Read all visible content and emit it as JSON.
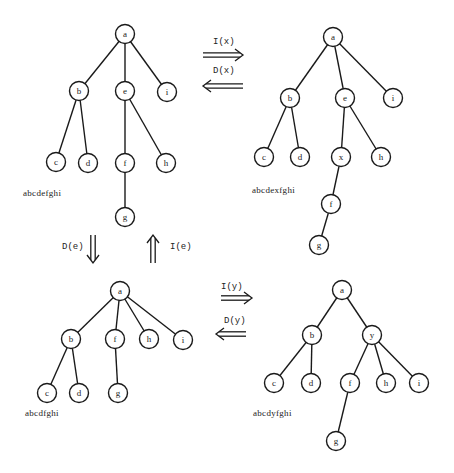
{
  "trees": [
    {
      "id": "original",
      "sequence": "abcdefghi",
      "sequence_pos": [
        23,
        196
      ],
      "nodes": [
        {
          "id": "a",
          "x": 125,
          "y": 34
        },
        {
          "id": "b",
          "x": 79,
          "y": 91
        },
        {
          "id": "e",
          "x": 125,
          "y": 91
        },
        {
          "id": "i",
          "x": 167,
          "y": 92
        },
        {
          "id": "c",
          "x": 56,
          "y": 162
        },
        {
          "id": "d",
          "x": 88,
          "y": 163
        },
        {
          "id": "f",
          "x": 125,
          "y": 163
        },
        {
          "id": "h",
          "x": 166,
          "y": 163
        },
        {
          "id": "g",
          "x": 125,
          "y": 217
        }
      ],
      "edges": [
        [
          "a",
          "b"
        ],
        [
          "a",
          "e"
        ],
        [
          "a",
          "i"
        ],
        [
          "b",
          "c"
        ],
        [
          "b",
          "d"
        ],
        [
          "e",
          "f"
        ],
        [
          "e",
          "h"
        ],
        [
          "f",
          "g"
        ]
      ]
    },
    {
      "id": "insert-x",
      "sequence": "abcdexfghi",
      "sequence_pos": [
        252,
        193
      ],
      "nodes": [
        {
          "id": "a",
          "x": 333,
          "y": 37
        },
        {
          "id": "b",
          "x": 290,
          "y": 98
        },
        {
          "id": "e",
          "x": 345,
          "y": 98
        },
        {
          "id": "i",
          "x": 393,
          "y": 98
        },
        {
          "id": "c",
          "x": 264,
          "y": 157
        },
        {
          "id": "d",
          "x": 300,
          "y": 157
        },
        {
          "id": "x",
          "x": 341,
          "y": 157
        },
        {
          "id": "h",
          "x": 381,
          "y": 157
        },
        {
          "id": "f",
          "x": 331,
          "y": 204
        },
        {
          "id": "g",
          "x": 319,
          "y": 245
        }
      ],
      "edges": [
        [
          "a",
          "b"
        ],
        [
          "a",
          "e"
        ],
        [
          "a",
          "i"
        ],
        [
          "b",
          "c"
        ],
        [
          "b",
          "d"
        ],
        [
          "e",
          "x"
        ],
        [
          "e",
          "h"
        ],
        [
          "x",
          "f"
        ],
        [
          "f",
          "g"
        ]
      ]
    },
    {
      "id": "delete-e",
      "sequence": "abcdfghi",
      "sequence_pos": [
        25,
        416
      ],
      "nodes": [
        {
          "id": "a",
          "x": 120,
          "y": 291
        },
        {
          "id": "b",
          "x": 71,
          "y": 339
        },
        {
          "id": "f",
          "x": 115,
          "y": 339
        },
        {
          "id": "h",
          "x": 149,
          "y": 339
        },
        {
          "id": "i",
          "x": 183,
          "y": 340
        },
        {
          "id": "c",
          "x": 47,
          "y": 393
        },
        {
          "id": "d",
          "x": 79,
          "y": 393
        },
        {
          "id": "g",
          "x": 118,
          "y": 393
        }
      ],
      "edges": [
        [
          "a",
          "b"
        ],
        [
          "a",
          "f"
        ],
        [
          "a",
          "h"
        ],
        [
          "a",
          "i"
        ],
        [
          "b",
          "c"
        ],
        [
          "b",
          "d"
        ],
        [
          "f",
          "g"
        ]
      ]
    },
    {
      "id": "insert-y",
      "sequence": "abcdyfghi",
      "sequence_pos": [
        253,
        416
      ],
      "nodes": [
        {
          "id": "a",
          "x": 342,
          "y": 290
        },
        {
          "id": "b",
          "x": 312,
          "y": 335
        },
        {
          "id": "y",
          "x": 372,
          "y": 335
        },
        {
          "id": "c",
          "x": 274,
          "y": 383
        },
        {
          "id": "d",
          "x": 311,
          "y": 383
        },
        {
          "id": "f",
          "x": 350,
          "y": 383
        },
        {
          "id": "h",
          "x": 386,
          "y": 383
        },
        {
          "id": "i",
          "x": 419,
          "y": 383
        },
        {
          "id": "g",
          "x": 336,
          "y": 441
        }
      ],
      "edges": [
        [
          "a",
          "b"
        ],
        [
          "a",
          "y"
        ],
        [
          "b",
          "c"
        ],
        [
          "b",
          "d"
        ],
        [
          "y",
          "f"
        ],
        [
          "y",
          "h"
        ],
        [
          "y",
          "i"
        ],
        [
          "f",
          "g"
        ]
      ]
    }
  ],
  "operations": [
    {
      "id": "op-insert-x",
      "label": "I(x)",
      "direction": "right",
      "label_pos": [
        213,
        44
      ],
      "arrow": [
        203,
        55,
        243,
        55
      ]
    },
    {
      "id": "op-delete-x",
      "label": "D(x)",
      "direction": "left",
      "label_pos": [
        213,
        73
      ],
      "arrow": [
        243,
        86,
        203,
        86
      ]
    },
    {
      "id": "op-delete-e",
      "label": "D(e)",
      "direction": "down",
      "label_pos": [
        62,
        249
      ],
      "arrow": [
        93,
        235,
        93,
        263
      ]
    },
    {
      "id": "op-insert-e",
      "label": "I(e)",
      "direction": "up",
      "label_pos": [
        170,
        249
      ],
      "arrow": [
        153,
        263,
        153,
        235
      ]
    },
    {
      "id": "op-insert-y",
      "label": "I(y)",
      "direction": "right",
      "label_pos": [
        221,
        289
      ],
      "arrow": [
        221,
        298,
        252,
        298
      ]
    },
    {
      "id": "op-delete-y",
      "label": "D(y)",
      "direction": "left",
      "label_pos": [
        224,
        323
      ],
      "arrow": [
        246,
        334,
        216,
        334
      ]
    }
  ],
  "style": {
    "node_radius": 9.5,
    "stroke": "#1a1a1a",
    "background": "#ffffff"
  }
}
